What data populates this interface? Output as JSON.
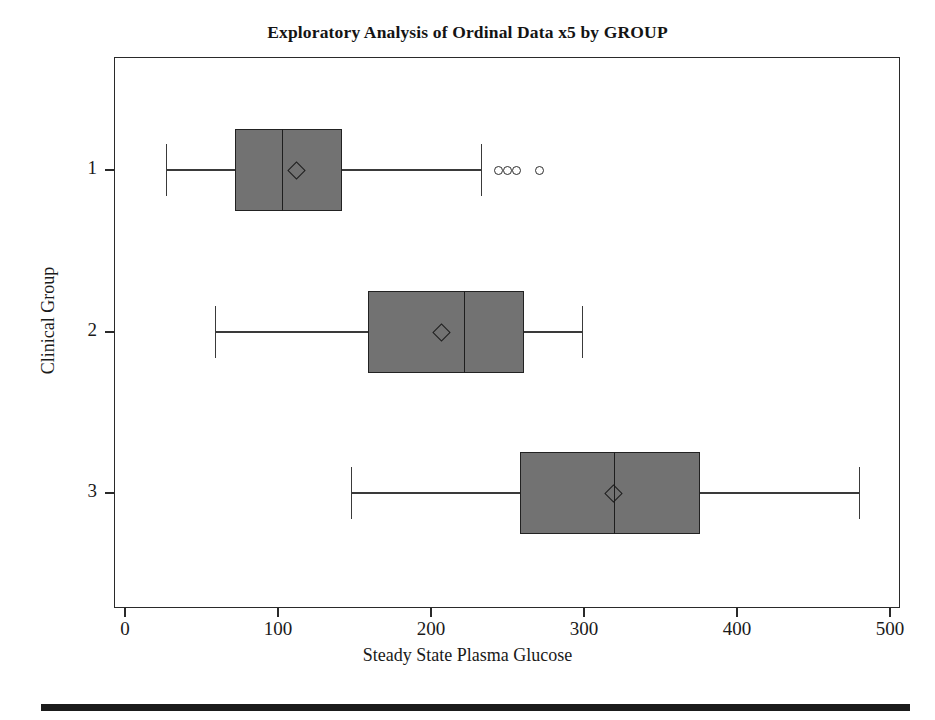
{
  "chart_data": {
    "type": "box",
    "orientation": "horizontal",
    "title": "Exploratory Analysis of Ordinal Data x5 by GROUP",
    "xlabel": "Steady State Plasma Glucose",
    "ylabel": "Clinical Group",
    "xlim": [
      0,
      500
    ],
    "xticks": [
      0,
      100,
      200,
      300,
      400,
      500
    ],
    "xtick_labels": [
      "0",
      "100",
      "200",
      "300",
      "400",
      "500"
    ],
    "yticks": [
      1,
      2,
      3
    ],
    "ytick_labels": [
      "1",
      "2",
      "3"
    ],
    "grid": false,
    "legend": null,
    "box_fill_color": "#727272",
    "box_edge_color": "#222222",
    "boxes": [
      {
        "group": "1",
        "whisker_low": 27,
        "q1": 72,
        "median": 103,
        "q3": 142,
        "whisker_high": 233,
        "mean": 112,
        "outliers": [
          244,
          250,
          256,
          271
        ]
      },
      {
        "group": "2",
        "whisker_low": 59,
        "q1": 159,
        "median": 222,
        "q3": 261,
        "whisker_high": 299,
        "mean": 207,
        "outliers": []
      },
      {
        "group": "3",
        "whisker_low": 148,
        "q1": 258,
        "median": 320,
        "q3": 376,
        "whisker_high": 480,
        "mean": 319,
        "outliers": []
      }
    ]
  },
  "figure": {
    "title": "Exploratory Analysis of Ordinal Data x5 by GROUP",
    "x_axis_label": "Steady State Plasma Glucose",
    "y_axis_label": "Clinical Group"
  }
}
